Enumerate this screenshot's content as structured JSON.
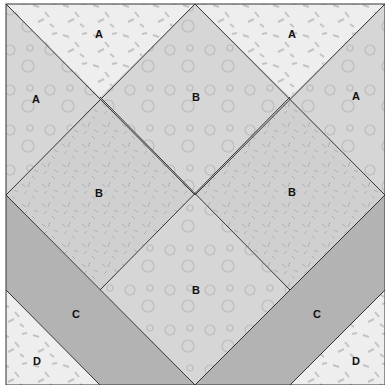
{
  "diagram": {
    "type": "quilt-block",
    "colors": {
      "A_light": "#ededed",
      "A_mid": "#d3d3d3",
      "B_cloud": "#d6d6d6",
      "B_leaf": "#cfcfcf",
      "C": "#b3b3b3",
      "D": "#ececec",
      "line": "#333333"
    },
    "labels": {
      "a_top_left": "A",
      "a_top_right": "A",
      "a_left": "A",
      "a_right": "A",
      "b_top": "B",
      "b_left": "B",
      "b_right": "B",
      "b_bottom": "B",
      "c_left": "C",
      "c_right": "C",
      "d_left": "D",
      "d_right": "D"
    }
  }
}
